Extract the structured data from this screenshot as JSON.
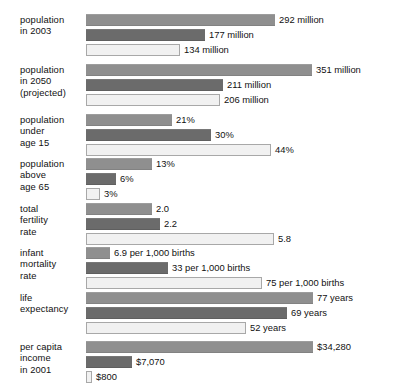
{
  "chart_data": {
    "type": "bar",
    "title": "",
    "orientation": "horizontal",
    "xlabel": "",
    "ylabel": "",
    "grid": false,
    "legend": "none",
    "series": [
      {
        "name": "series-1",
        "color": "#8f8f8f"
      },
      {
        "name": "series-2",
        "color": "#6b6b6b"
      },
      {
        "name": "series-3",
        "color": "#f1f1f1"
      }
    ],
    "groups": [
      {
        "label_lines": [
          "population",
          "in 2003"
        ],
        "bars": [
          {
            "value": 292,
            "label": "292 million",
            "width": 189
          },
          {
            "value": 177,
            "label": "177 million",
            "width": 119
          },
          {
            "value": 134,
            "label": "134 million",
            "width": 94
          }
        ]
      },
      {
        "label_lines": [
          "population",
          "in 2050",
          "(projected)"
        ],
        "bars": [
          {
            "value": 351,
            "label": "351 million",
            "width": 226
          },
          {
            "value": 211,
            "label": "211 million",
            "width": 137
          },
          {
            "value": 206,
            "label": "206 million",
            "width": 134
          }
        ]
      },
      {
        "label_lines": [
          "population",
          "under",
          "age 15"
        ],
        "bars": [
          {
            "value": 21,
            "label": "21%",
            "width": 86
          },
          {
            "value": 30,
            "label": "30%",
            "width": 125
          },
          {
            "value": 44,
            "label": "44%",
            "width": 185
          }
        ]
      },
      {
        "label_lines": [
          "population",
          "above",
          "age 65"
        ],
        "bars": [
          {
            "value": 13,
            "label": "13%",
            "width": 66
          },
          {
            "value": 6,
            "label": "6%",
            "width": 30
          },
          {
            "value": 3,
            "label": "3%",
            "width": 14
          }
        ]
      },
      {
        "label_lines": [
          "total",
          "fertility",
          "rate"
        ],
        "bars": [
          {
            "value": 2.0,
            "label": "2.0",
            "width": 66
          },
          {
            "value": 2.2,
            "label": "2.2",
            "width": 74
          },
          {
            "value": 5.8,
            "label": "5.8",
            "width": 188
          }
        ]
      },
      {
        "label_lines": [
          "infant",
          "mortality",
          "rate"
        ],
        "bars": [
          {
            "value": 6.9,
            "label": "6.9 per 1,000 births",
            "width": 24
          },
          {
            "value": 33,
            "label": "33 per 1,000 births",
            "width": 82
          },
          {
            "value": 75,
            "label": "75 per 1,000 births",
            "width": 176
          }
        ]
      },
      {
        "label_lines": [
          "life",
          "expectancy"
        ],
        "bars": [
          {
            "value": 77,
            "label": "77 years",
            "width": 227
          },
          {
            "value": 69,
            "label": "69 years",
            "width": 201
          },
          {
            "value": 52,
            "label": "52 years",
            "width": 160
          }
        ]
      },
      {
        "label_lines": [
          "per capita",
          "income",
          "in 2001"
        ],
        "bars": [
          {
            "value": 34280,
            "label": "$34,280",
            "width": 227
          },
          {
            "value": 7070,
            "label": "$7,070",
            "width": 46
          },
          {
            "value": 800,
            "label": "$800",
            "width": 6
          }
        ]
      }
    ]
  }
}
